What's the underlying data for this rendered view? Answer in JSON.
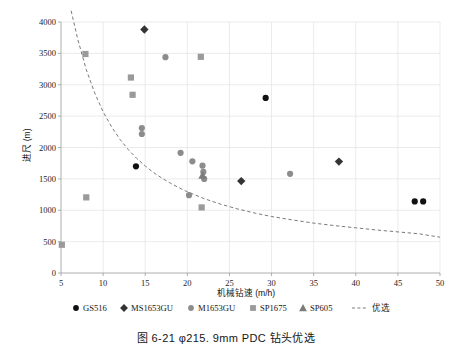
{
  "figure": {
    "caption": "图 6-21    φ215. 9mm PDC 钻头优选",
    "caption_number": "图 6-21",
    "caption_text": "φ215. 9mm PDC 钻头优选"
  },
  "chart_data": {
    "type": "scatter",
    "title": "",
    "xlabel": "机械钻速 (m/h)",
    "ylabel": "进尺 (m)",
    "xlim": [
      5,
      50
    ],
    "ylim": [
      0,
      4000
    ],
    "xticks": [
      5,
      10,
      15,
      20,
      25,
      30,
      35,
      40,
      45,
      50
    ],
    "yticks": [
      0,
      500,
      1000,
      1500,
      2000,
      2500,
      3000,
      3500,
      4000
    ],
    "grid": true,
    "legend_position": "below-axis",
    "series": [
      {
        "name": "GS516",
        "marker": "circle",
        "color": "#111111",
        "points": [
          [
            13.9,
            1700
          ],
          [
            29.3,
            2790
          ],
          [
            47.0,
            1140
          ],
          [
            48.0,
            1140
          ]
        ]
      },
      {
        "name": "MS1653GU",
        "marker": "diamond",
        "color": "#333333",
        "points": [
          [
            14.9,
            3880
          ],
          [
            26.4,
            1465
          ],
          [
            38.0,
            1775
          ]
        ]
      },
      {
        "name": "M1653GU",
        "marker": "circle",
        "color": "#8c8c8c",
        "points": [
          [
            14.6,
            2310
          ],
          [
            14.6,
            2215
          ],
          [
            17.4,
            3440
          ],
          [
            19.2,
            1915
          ],
          [
            20.2,
            1240
          ],
          [
            20.6,
            1780
          ],
          [
            21.8,
            1710
          ],
          [
            21.9,
            1610
          ],
          [
            22.0,
            1500
          ],
          [
            32.2,
            1580
          ]
        ]
      },
      {
        "name": "SP1675",
        "marker": "square",
        "color": "#9a9a9a",
        "points": [
          [
            5.1,
            450
          ],
          [
            8.0,
            1205
          ],
          [
            7.9,
            3490
          ],
          [
            13.3,
            3115
          ],
          [
            13.5,
            2840
          ],
          [
            21.6,
            3445
          ],
          [
            21.7,
            1045
          ]
        ]
      },
      {
        "name": "SP605",
        "marker": "triangle",
        "color": "#7c7c7c",
        "points": [
          [
            21.8,
            1555
          ]
        ]
      }
    ],
    "reference_curve": {
      "name": "优选",
      "style": "dashed",
      "color": "#6b6b6b",
      "points": [
        [
          6.2,
          4180
        ],
        [
          7.0,
          3720
        ],
        [
          8.0,
          3240
        ],
        [
          9.0,
          2870
        ],
        [
          10.0,
          2570
        ],
        [
          11.0,
          2330
        ],
        [
          12.0,
          2130
        ],
        [
          13.0,
          1965
        ],
        [
          14.0,
          1825
        ],
        [
          15.0,
          1705
        ],
        [
          16.0,
          1600
        ],
        [
          17.0,
          1510
        ],
        [
          18.0,
          1430
        ],
        [
          19.0,
          1360
        ],
        [
          20.0,
          1295
        ],
        [
          22.0,
          1185
        ],
        [
          24.0,
          1095
        ],
        [
          26.0,
          1020
        ],
        [
          28.0,
          955
        ],
        [
          30.0,
          900
        ],
        [
          32.5,
          845
        ],
        [
          35.0,
          795
        ],
        [
          37.5,
          755
        ],
        [
          40.0,
          720
        ],
        [
          42.5,
          685
        ],
        [
          45.0,
          655
        ],
        [
          47.5,
          625
        ],
        [
          50.0,
          570
        ]
      ]
    },
    "legend": [
      {
        "label": "GS516",
        "marker": "circle",
        "color": "#111111"
      },
      {
        "label": "MS1653GU",
        "marker": "diamond",
        "color": "#333333"
      },
      {
        "label": "M1653GU",
        "marker": "circle",
        "color": "#8c8c8c"
      },
      {
        "label": "SP1675",
        "marker": "square",
        "color": "#9a9a9a"
      },
      {
        "label": "SP605",
        "marker": "triangle",
        "color": "#7c7c7c"
      },
      {
        "label": "优选",
        "marker": "dashed-line",
        "color": "#6b6b6b"
      }
    ]
  }
}
